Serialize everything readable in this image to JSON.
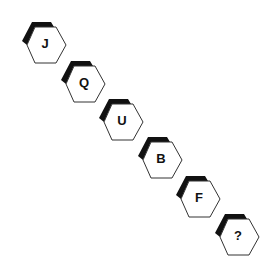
{
  "puzzle": {
    "sequence": [
      {
        "label": "J",
        "x": 18,
        "y": 19
      },
      {
        "label": "Q",
        "x": 57,
        "y": 58
      },
      {
        "label": "U",
        "x": 95,
        "y": 96
      },
      {
        "label": "B",
        "x": 134,
        "y": 134
      },
      {
        "label": "F",
        "x": 172,
        "y": 173
      },
      {
        "label": "?",
        "x": 211,
        "y": 211
      }
    ],
    "colors": {
      "outline": "#333333",
      "shadow": "#111111",
      "fill": "#ffffff"
    }
  }
}
